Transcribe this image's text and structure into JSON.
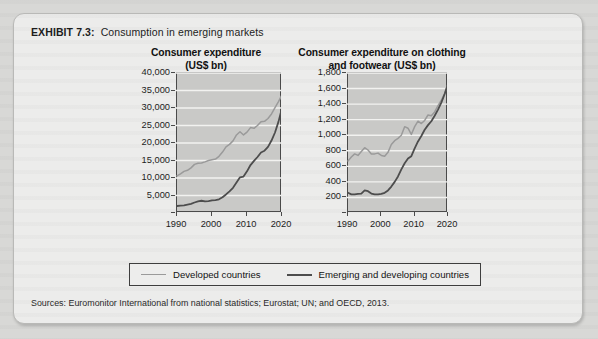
{
  "exhibit": {
    "label": "EXHIBIT 7.3:",
    "title": "Consumption in emerging markets",
    "sources": "Sources: Euromonitor International from national statistics; Eurostat; UN; and OECD, 2013."
  },
  "legend": {
    "items": [
      {
        "label": "Developed countries",
        "color": "#9a9a9a",
        "key": "developed"
      },
      {
        "label": "Emerging and developing countries",
        "color": "#4d4d4d",
        "key": "emerging"
      }
    ]
  },
  "colors": {
    "plot_background": "#c9c9c7",
    "gridline": "#f2f2f0",
    "axis": "#4a4a4a",
    "developed_line": "#9a9a9a",
    "emerging_line": "#4d4d4d",
    "card_background": "#ececeb",
    "page_background": "#d8d8d6"
  },
  "chart_data": [
    {
      "id": "consumer-expenditure",
      "type": "line",
      "title": "Consumer expenditure\n(US$ bn)",
      "title_lines": [
        "Consumer expenditure",
        "(US$ bn)"
      ],
      "xlabel": "",
      "ylabel": "",
      "xlim": [
        1990,
        2020
      ],
      "ylim": [
        0,
        40000
      ],
      "ytick_labels": [
        "40,000",
        "35,000",
        "30,000",
        "25,000",
        "20,000",
        "15,000",
        "10,000",
        "5,000",
        ""
      ],
      "ytick_values": [
        40000,
        35000,
        30000,
        25000,
        20000,
        15000,
        10000,
        5000,
        0
      ],
      "xtick_labels": [
        "1990",
        "2000",
        "2010",
        "2020"
      ],
      "xtick_values": [
        1990,
        2000,
        2010,
        2020
      ],
      "grid": true,
      "legend_position": "below-both-charts",
      "x": [
        1990,
        1991,
        1992,
        1993,
        1994,
        1995,
        1996,
        1997,
        1998,
        1999,
        2000,
        2001,
        2002,
        2003,
        2004,
        2005,
        2006,
        2007,
        2008,
        2009,
        2010,
        2011,
        2012,
        2013,
        2014,
        2015,
        2016,
        2017,
        2018,
        2019,
        2020
      ],
      "series": [
        {
          "name": "Developed countries",
          "color": "#9a9a9a",
          "values": [
            10600,
            11200,
            11900,
            12200,
            12900,
            13900,
            14200,
            14300,
            14600,
            15000,
            15200,
            15400,
            16200,
            17400,
            18900,
            19600,
            20600,
            22300,
            23200,
            22300,
            23100,
            24400,
            24200,
            25000,
            26100,
            26200,
            27000,
            28300,
            30100,
            31800,
            33800
          ]
        },
        {
          "name": "Emerging and developing countries",
          "color": "#4d4d4d",
          "values": [
            2000,
            2100,
            2200,
            2400,
            2600,
            3000,
            3300,
            3500,
            3300,
            3400,
            3600,
            3700,
            3900,
            4500,
            5300,
            6200,
            7200,
            8700,
            10200,
            10400,
            11900,
            13700,
            14900,
            16000,
            17300,
            17800,
            18900,
            20700,
            23000,
            26100,
            30000
          ]
        }
      ]
    },
    {
      "id": "clothing-and-footwear-expenditure",
      "type": "line",
      "title": "Consumer expenditure on clothing\nand footwear (US$ bn)",
      "title_lines": [
        "Consumer expenditure on clothing",
        "and footwear (US$ bn)"
      ],
      "xlabel": "",
      "ylabel": "",
      "xlim": [
        1990,
        2020
      ],
      "ylim": [
        0,
        1800
      ],
      "ytick_labels": [
        "1,800",
        "1,600",
        "1,400",
        "1,200",
        "1,000",
        "800",
        "600",
        "400",
        "200",
        ""
      ],
      "ytick_values": [
        1800,
        1600,
        1400,
        1200,
        1000,
        800,
        600,
        400,
        200,
        0
      ],
      "xtick_labels": [
        "1990",
        "2000",
        "2010",
        "2020"
      ],
      "xtick_values": [
        1990,
        2000,
        2010,
        2020
      ],
      "grid": true,
      "legend_position": "below-both-charts",
      "x": [
        1990,
        1991,
        1992,
        1993,
        1994,
        1995,
        1996,
        1997,
        1998,
        1999,
        2000,
        2001,
        2002,
        2003,
        2004,
        2005,
        2006,
        2007,
        2008,
        2009,
        2010,
        2011,
        2012,
        2013,
        2014,
        2015,
        2016,
        2017,
        2018,
        2019,
        2020
      ],
      "series": [
        {
          "name": "Developed countries",
          "color": "#9a9a9a",
          "values": [
            670,
            720,
            760,
            740,
            790,
            840,
            810,
            760,
            760,
            770,
            740,
            730,
            780,
            880,
            930,
            960,
            1000,
            1110,
            1090,
            1010,
            1110,
            1180,
            1150,
            1190,
            1260,
            1250,
            1300,
            1380,
            1450,
            1540,
            1660
          ]
        },
        {
          "name": "Emerging and developing countries",
          "color": "#4d4d4d",
          "values": [
            260,
            240,
            240,
            245,
            250,
            290,
            280,
            250,
            240,
            240,
            245,
            260,
            290,
            340,
            400,
            470,
            560,
            640,
            700,
            730,
            830,
            920,
            990,
            1070,
            1130,
            1180,
            1250,
            1330,
            1420,
            1530,
            1660
          ]
        }
      ]
    }
  ]
}
